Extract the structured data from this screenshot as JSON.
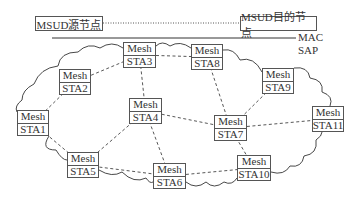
{
  "header": {
    "source_node": "MSUD源节点",
    "dest_node": "MSUD目的节点",
    "mac_label": "MAC",
    "sap_label": "SAP"
  },
  "nodes": [
    {
      "id": "STA1",
      "top": "Mesh",
      "bottom": "STA1",
      "x": 17,
      "y": 110,
      "w": 32,
      "h": 26
    },
    {
      "id": "STA2",
      "top": "Mesh",
      "bottom": "STA2",
      "x": 59,
      "y": 69,
      "w": 32,
      "h": 26
    },
    {
      "id": "STA3",
      "top": "Mesh",
      "bottom": "STA3",
      "x": 123,
      "y": 42,
      "w": 33,
      "h": 26
    },
    {
      "id": "STA4",
      "top": "Mesh",
      "bottom": "STA4",
      "x": 129,
      "y": 98,
      "w": 33,
      "h": 26
    },
    {
      "id": "STA5",
      "top": "Mesh",
      "bottom": "STA5",
      "x": 67,
      "y": 152,
      "w": 32,
      "h": 26
    },
    {
      "id": "STA6",
      "top": "Mesh",
      "bottom": "STA6",
      "x": 153,
      "y": 163,
      "w": 33,
      "h": 26
    },
    {
      "id": "STA7",
      "top": "Mesh",
      "bottom": "STA7",
      "x": 214,
      "y": 115,
      "w": 33,
      "h": 26
    },
    {
      "id": "STA8",
      "top": "Mesh",
      "bottom": "STA8",
      "x": 191,
      "y": 44,
      "w": 32,
      "h": 26
    },
    {
      "id": "STA9",
      "top": "Mesh",
      "bottom": "STA9",
      "x": 262,
      "y": 68,
      "w": 32,
      "h": 26
    },
    {
      "id": "STA10",
      "top": "Mesh",
      "bottom": "STA10",
      "x": 237,
      "y": 155,
      "w": 34,
      "h": 26
    },
    {
      "id": "STA11",
      "top": "Mesh",
      "bottom": "STA11",
      "x": 312,
      "y": 106,
      "w": 32,
      "h": 26
    }
  ],
  "edges": [
    [
      "STA3",
      "STA8"
    ],
    [
      "STA3",
      "STA2"
    ],
    [
      "STA3",
      "STA4"
    ],
    [
      "STA2",
      "STA1"
    ],
    [
      "STA8",
      "STA7"
    ],
    [
      "STA9",
      "STA7"
    ],
    [
      "STA4",
      "STA7"
    ],
    [
      "STA4",
      "STA5"
    ],
    [
      "STA4",
      "STA6"
    ],
    [
      "STA7",
      "STA11"
    ],
    [
      "STA7",
      "STA10"
    ],
    [
      "STA1",
      "STA5"
    ],
    [
      "STA5",
      "STA6"
    ],
    [
      "STA6",
      "STA10"
    ]
  ],
  "colors": {
    "line": "#444444",
    "box_border": "#555555"
  }
}
